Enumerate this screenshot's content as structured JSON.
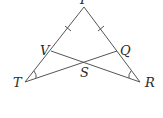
{
  "diagram": {
    "type": "geometry",
    "points": {
      "P": {
        "label": "P",
        "x": 84,
        "y": 7
      },
      "T": {
        "label": "T",
        "x": 25,
        "y": 82
      },
      "R": {
        "label": "R",
        "x": 140,
        "y": 82
      },
      "V": {
        "label": "V",
        "x": 51,
        "y": 51
      },
      "Q": {
        "label": "Q",
        "x": 117,
        "y": 51
      },
      "S": {
        "label": "S",
        "x": 84,
        "y": 62
      }
    },
    "segments": [
      "PT",
      "PR",
      "TQ",
      "RV"
    ],
    "tick_marks": [
      "PV",
      "PQ"
    ],
    "angle_marks": [
      "PTQ",
      "PRV"
    ],
    "colors": {
      "line": "#555555",
      "text": "#2b2b2b",
      "background": "#ffffff"
    }
  }
}
